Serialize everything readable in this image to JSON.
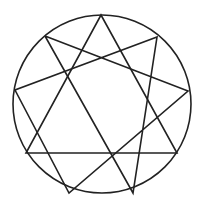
{
  "figure": {
    "type": "enneagram",
    "stroke_color": "#222222",
    "background": "#ffffff",
    "circle": {
      "cx": 102,
      "cy": 104,
      "r": 89
    },
    "points": [
      {
        "id": "top",
        "x": 101,
        "y": 15
      },
      {
        "id": "upper-right",
        "x": 157,
        "y": 37
      },
      {
        "id": "right",
        "x": 188,
        "y": 91
      },
      {
        "id": "lower-right",
        "x": 177,
        "y": 153
      },
      {
        "id": "bottom-right",
        "x": 133,
        "y": 193
      },
      {
        "id": "bottom-left",
        "x": 69,
        "y": 193
      },
      {
        "id": "lower-left",
        "x": 26,
        "y": 153
      },
      {
        "id": "left",
        "x": 15,
        "y": 90
      },
      {
        "id": "upper-left",
        "x": 45,
        "y": 36
      }
    ],
    "triangle": [
      "top",
      "lower-right",
      "lower-left"
    ],
    "hexad": [
      "upper-left",
      "right",
      "bottom-left",
      "left",
      "upper-right",
      "bottom-right",
      "upper-left"
    ]
  }
}
